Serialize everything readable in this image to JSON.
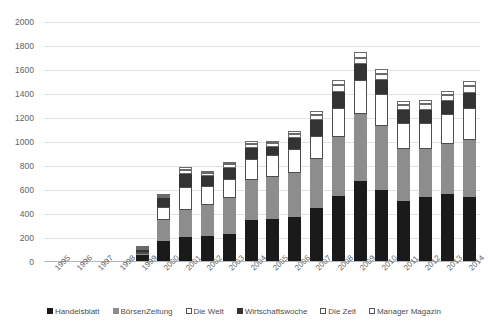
{
  "chart_data": {
    "type": "bar",
    "subtype": "stacked-bar",
    "title": "",
    "xlabel": "",
    "ylabel": "",
    "ylim": [
      0,
      2000
    ],
    "ytick_step": 200,
    "yticks": [
      0,
      200,
      400,
      600,
      800,
      1000,
      1200,
      1400,
      1600,
      1800,
      2000
    ],
    "grid": true,
    "legend_position": "bottom",
    "categories": [
      "1995",
      "1996",
      "1997",
      "1998",
      "1999",
      "2000",
      "2001",
      "2002",
      "2003",
      "2004",
      "2005",
      "2006",
      "2007",
      "2008",
      "2009",
      "2010",
      "2011",
      "2012",
      "2013",
      "2014"
    ],
    "series": [
      {
        "name": "Handelsblatt",
        "color": "#1a1a1a",
        "values": [
          4,
          8,
          6,
          8,
          60,
          175,
          205,
          215,
          235,
          350,
          360,
          375,
          450,
          550,
          675,
          600,
          510,
          545,
          570,
          545
        ]
      },
      {
        "name": "BörsenZeitung",
        "color": "#8d8d8d",
        "values": [
          0,
          0,
          0,
          0,
          5,
          175,
          225,
          260,
          300,
          330,
          345,
          370,
          405,
          490,
          560,
          535,
          430,
          400,
          415,
          470
        ]
      },
      {
        "name": "Die Welt",
        "color": "#ffffff",
        "values": [
          0,
          0,
          0,
          0,
          5,
          110,
          195,
          155,
          160,
          180,
          190,
          200,
          195,
          240,
          280,
          265,
          220,
          215,
          245,
          265
        ]
      },
      {
        "name": "Wirtschaftswoche",
        "color": "#333333",
        "values": [
          0,
          0,
          0,
          0,
          10,
          70,
          110,
          85,
          90,
          90,
          65,
          85,
          130,
          140,
          135,
          120,
          105,
          110,
          110,
          125
        ]
      },
      {
        "name": "Die Zeit",
        "color": "#ffffff",
        "values": [
          0,
          0,
          0,
          0,
          8,
          15,
          30,
          25,
          30,
          30,
          30,
          40,
          45,
          55,
          50,
          45,
          45,
          45,
          50,
          60
        ]
      },
      {
        "name": "Manager Magazin",
        "color": "#ffffff",
        "values": [
          0,
          0,
          0,
          0,
          5,
          15,
          25,
          20,
          20,
          25,
          20,
          25,
          30,
          40,
          50,
          40,
          35,
          35,
          35,
          40
        ]
      }
    ],
    "totals": [
      4,
      8,
      6,
      8,
      93,
      560,
      790,
      760,
      835,
      1005,
      1010,
      1095,
      1255,
      1515,
      1750,
      1605,
      1345,
      1350,
      1425,
      1505
    ]
  },
  "axis": {
    "y_tick_labels": [
      "2000",
      "1800",
      "1600",
      "1400",
      "1200",
      "1000",
      "800",
      "600",
      "400",
      "200",
      "0"
    ]
  },
  "legend": {
    "items": [
      {
        "label": "Handelsblatt",
        "swatch": "legend-swatch-black"
      },
      {
        "label": "BörsenZeitung",
        "swatch": "legend-swatch-gray"
      },
      {
        "label": "Die Welt",
        "swatch": "legend-swatch-white"
      },
      {
        "label": "Wirtschaftswoche",
        "swatch": "legend-swatch-darkgray"
      },
      {
        "label": "Die Zeit",
        "swatch": "legend-swatch-white"
      },
      {
        "label": "Manager Magazin",
        "swatch": "legend-swatch-white"
      }
    ]
  }
}
